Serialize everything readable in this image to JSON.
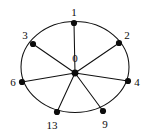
{
  "figure": {
    "name": "wheel-graph-diagram",
    "width": 147,
    "height": 139,
    "background_color": "#ffffff",
    "stroke_color": "#101010",
    "node_color": "#0c0c0c",
    "label_color": "#0c0c0c"
  },
  "chart_data": {
    "type": "diagram",
    "subtype": "wheel-graph",
    "title": "",
    "xlabel": "",
    "ylabel": "",
    "grid": false,
    "legend": null,
    "ellipse": {
      "cx": 75,
      "cy": 67,
      "rx": 54,
      "ry": 45.5
    },
    "hub": {
      "id": "0",
      "label": "0",
      "x": 75,
      "y": 73,
      "label_x": 75,
      "label_y": 58
    },
    "nodes": [
      {
        "id": "1",
        "label": "1",
        "x": 74,
        "y": 23,
        "label_x": 74,
        "label_y": 12,
        "anchor": "center"
      },
      {
        "id": "2",
        "label": "2",
        "x": 119,
        "y": 43,
        "label_x": 127,
        "label_y": 35,
        "anchor": "center"
      },
      {
        "id": "3",
        "label": "3",
        "x": 33,
        "y": 44,
        "label_x": 25,
        "label_y": 35,
        "anchor": "center"
      },
      {
        "id": "4",
        "label": "4",
        "x": 128,
        "y": 81,
        "label_x": 137,
        "label_y": 82,
        "anchor": "center"
      },
      {
        "id": "6",
        "label": "6",
        "x": 22,
        "y": 82,
        "label_x": 13,
        "label_y": 82,
        "anchor": "center"
      },
      {
        "id": "9",
        "label": "9",
        "x": 103,
        "y": 111,
        "label_x": 105,
        "label_y": 124,
        "anchor": "center"
      },
      {
        "id": "13",
        "label": "13",
        "x": 57,
        "y": 112,
        "label_x": 52,
        "label_y": 125,
        "anchor": "center"
      }
    ],
    "edges": [
      {
        "from": "0",
        "to": "1"
      },
      {
        "from": "0",
        "to": "2"
      },
      {
        "from": "0",
        "to": "3"
      },
      {
        "from": "0",
        "to": "4"
      },
      {
        "from": "0",
        "to": "6"
      },
      {
        "from": "0",
        "to": "9"
      },
      {
        "from": "0",
        "to": "13"
      }
    ],
    "node_radius": 3.1,
    "hub_radius": 3.4
  }
}
